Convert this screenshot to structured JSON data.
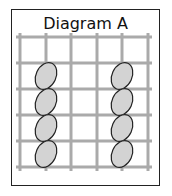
{
  "diagram": {
    "title": "Diagram A",
    "grid": {
      "columns_x": [
        20,
        46,
        71,
        97,
        122,
        148
      ],
      "rows_y": [
        37,
        63,
        89,
        115,
        141,
        167
      ],
      "line_color": "#aaaaaa"
    },
    "ellipses": [
      {
        "cx": 46,
        "cy": 76
      },
      {
        "cx": 46,
        "cy": 102
      },
      {
        "cx": 46,
        "cy": 128
      },
      {
        "cx": 46,
        "cy": 154
      },
      {
        "cx": 122,
        "cy": 76
      },
      {
        "cx": 122,
        "cy": 102
      },
      {
        "cx": 122,
        "cy": 128
      },
      {
        "cx": 122,
        "cy": 154
      }
    ],
    "ellipse_fill": "#d3d3d3",
    "ellipse_stroke": "#222222"
  }
}
